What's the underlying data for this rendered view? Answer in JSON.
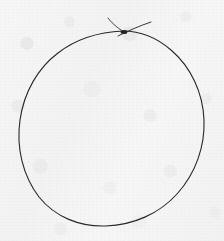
{
  "canvas": {
    "width": 224,
    "height": 241,
    "background_color": "#f5f5f5",
    "paper_tint_color": "#f2f2f2",
    "grain_color": "#c8c8cc",
    "title": "hand-drawn circle sketch"
  },
  "drawing": {
    "medium": "pen on paper",
    "stroke_color": "#333333",
    "stroke_color_dark": "#262626",
    "stroke_width": 1.1,
    "subject": "circle",
    "description": "A single freehand closed circle drawn in dark pen, with the start and end of the stroke overshooting and crossing near the top, leaving two short tails.",
    "shapes": [
      {
        "name": "circle-body",
        "kind": "closed-freehand-ellipse",
        "center_x": 112,
        "center_y": 128,
        "radius_x": 92,
        "radius_y": 97,
        "bounds": {
          "left": 20,
          "top": 31,
          "right": 205,
          "bottom": 226
        },
        "path": "M 123 31 C 100 32 76 39 58 53 C 38 68 24 92 20 120 C 16 148 23 176 39 197 C 55 217 80 227 106 226 C 133 225 159 214 177 194 C 196 173 205 146 204 120 C 203 93 191 67 171 50 C 156 37 140 31 123 31 Z"
      },
      {
        "name": "stroke-start-tail",
        "kind": "open-tail",
        "path": "M 108 18 C 111 22 116 27 124 32",
        "from_x": 108,
        "from_y": 18,
        "to_x": 124,
        "to_y": 32
      },
      {
        "name": "stroke-end-tail",
        "kind": "open-tail",
        "path": "M 118 36 C 128 31 139 26 151 22",
        "from_x": 118,
        "from_y": 36,
        "to_x": 151,
        "to_y": 22
      },
      {
        "name": "crossing-blob",
        "kind": "ink-pool",
        "center_x": 124,
        "center_y": 32,
        "radius_x": 3.4,
        "radius_y": 2.1
      }
    ]
  }
}
